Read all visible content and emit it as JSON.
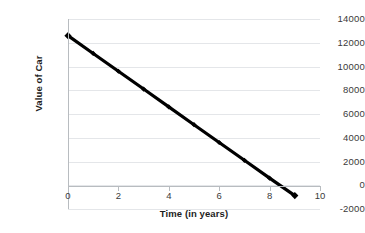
{
  "chart_data": {
    "type": "line",
    "title": "",
    "xlabel": "Time (in years)",
    "ylabel": "Value of Car",
    "x": [
      0,
      1,
      2,
      3,
      4,
      5,
      6,
      7,
      8,
      9
    ],
    "values": [
      12600,
      11100,
      9600,
      8100,
      6600,
      5100,
      3600,
      2100,
      600,
      -870
    ],
    "series": [
      {
        "name": "Value of Car",
        "values": [
          12600,
          11100,
          9600,
          8100,
          6600,
          5100,
          3600,
          2100,
          600,
          -870
        ]
      }
    ],
    "xlim": [
      0,
      10
    ],
    "ylim": [
      -2000,
      14000
    ],
    "xticks": [
      "0",
      "2",
      "4",
      "6",
      "8",
      "10"
    ],
    "xtick_values": [
      0,
      2,
      4,
      6,
      8,
      10
    ],
    "yticks": [
      "14000",
      "12000",
      "10000",
      "8000",
      "6000",
      "4000",
      "2000",
      "0",
      "-2000"
    ],
    "ytick_values": [
      14000,
      12000,
      10000,
      8000,
      6000,
      4000,
      2000,
      0,
      -2000
    ],
    "grid": "horizontal",
    "legend": "none",
    "line_color": "#000000",
    "marker": "diamond",
    "grid_color": "#e4e6e9",
    "axis_color": "#b8bcc0",
    "background": "#ffffff"
  }
}
